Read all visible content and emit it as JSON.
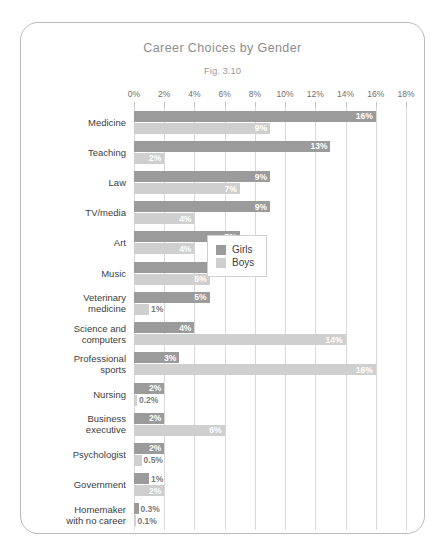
{
  "chart_data": {
    "type": "bar",
    "orientation": "horizontal",
    "title": "Career Choices by Gender",
    "subtitle": "Fig. 3.10",
    "xlabel": "",
    "ylabel": "",
    "xlim": [
      0,
      18
    ],
    "xticks": [
      "0%",
      "2%",
      "4%",
      "6%",
      "8%",
      "10%",
      "12%",
      "14%",
      "16%",
      "18%"
    ],
    "xtick_values": [
      0,
      2,
      4,
      6,
      8,
      10,
      12,
      14,
      16,
      18
    ],
    "grid": true,
    "legend_position": "middle-right",
    "categories": [
      "Medicine",
      "Teaching",
      "Law",
      "TV/media",
      "Art",
      "Music",
      "Veterinary medicine",
      "Science and computers",
      "Professional sports",
      "Nursing",
      "Business executive",
      "Psychologist",
      "Government",
      "Homemaker with no career"
    ],
    "category_lines": [
      [
        "Medicine"
      ],
      [
        "Teaching"
      ],
      [
        "Law"
      ],
      [
        "TV/media"
      ],
      [
        "Art"
      ],
      [
        "Music"
      ],
      [
        "Veterinary",
        "medicine"
      ],
      [
        "Science and",
        "computers"
      ],
      [
        "Professional",
        "sports"
      ],
      [
        "Nursing"
      ],
      [
        "Business",
        "executive"
      ],
      [
        "Psychologist"
      ],
      [
        "Government"
      ],
      [
        "Homemaker",
        "with no career"
      ]
    ],
    "series": [
      {
        "name": "Girls",
        "color": "#9b9b9b",
        "values": [
          16,
          13,
          9,
          9,
          7,
          6,
          5,
          4,
          3,
          2,
          2,
          2,
          1,
          0.3
        ],
        "labels": [
          "16%",
          "13%",
          "9%",
          "9%",
          "7%",
          "6%",
          "5%",
          "4%",
          "3%",
          "2%",
          "2%",
          "2%",
          "1%",
          "0.3%"
        ]
      },
      {
        "name": "Boys",
        "color": "#cfcfcf",
        "values": [
          9,
          2,
          7,
          4,
          4,
          5,
          1,
          14,
          16,
          0.2,
          6,
          0.5,
          2,
          0.1
        ],
        "labels": [
          "9%",
          "2%",
          "7%",
          "4%",
          "4%",
          "5%",
          "1%",
          "14%",
          "16%",
          "0.2%",
          "6%",
          "0.5%",
          "2%",
          "0.1%"
        ]
      }
    ]
  },
  "legend": {
    "items": [
      {
        "label": "Girls"
      },
      {
        "label": "Boys"
      }
    ]
  }
}
